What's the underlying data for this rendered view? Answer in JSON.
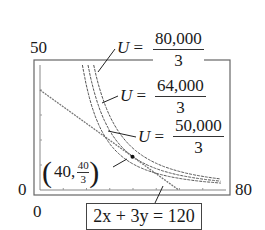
{
  "chart_data": {
    "type": "line",
    "title": "",
    "xlabel": "",
    "ylabel": "",
    "xlim": [
      0,
      80
    ],
    "ylim": [
      0,
      50
    ],
    "grid": false,
    "tick_labels": {
      "x_min": "0",
      "x_max": "80",
      "y_min": "0",
      "y_max": "50"
    },
    "series": [
      {
        "name": "2x + 3y = 120",
        "kind": "constraint-line",
        "points": [
          [
            0,
            40
          ],
          [
            60,
            0
          ]
        ]
      },
      {
        "name": "U = 50,000/3",
        "kind": "indifference-curve",
        "equation": "x^2 y = 50000/3"
      },
      {
        "name": "U = 64,000/3",
        "kind": "indifference-curve",
        "equation": "x^2 y = 64000/3"
      },
      {
        "name": "U = 80,000/3",
        "kind": "indifference-curve",
        "equation": "x^2 y = 80000/3"
      }
    ],
    "annotations": [
      {
        "text": "(40, 40/3)",
        "point": [
          40,
          13.333
        ]
      },
      {
        "text": "2x + 3y = 120",
        "target": "constraint-line"
      }
    ]
  },
  "labels": {
    "y_max": "50",
    "y_min": "0",
    "x_min": "0",
    "x_max": "80",
    "u1": {
      "lhs": "U",
      "eq": " =",
      "num": "80,000",
      "den": "3"
    },
    "u2": {
      "lhs": "U",
      "eq": " =",
      "num": "64,000",
      "den": "3"
    },
    "u3": {
      "lhs": "U",
      "eq": " =",
      "num": "50,000",
      "den": "3"
    },
    "point": {
      "open": "(",
      "x": "40,",
      "num": "40",
      "den": "3",
      "close": ")"
    },
    "equation": "2x + 3y = 120"
  }
}
